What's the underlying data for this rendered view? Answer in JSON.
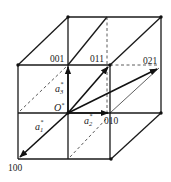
{
  "diagram": {
    "points": {
      "origin": {
        "label": "O",
        "superscript": "*"
      },
      "p001": {
        "label": "001"
      },
      "p011": {
        "label": "011"
      },
      "p021": {
        "label": "021"
      },
      "p010": {
        "label": "010"
      },
      "p100": {
        "label": "100"
      }
    },
    "vectors": {
      "a1": {
        "base": "a",
        "sub": "1",
        "sup": "*"
      },
      "a2": {
        "base": "a",
        "sub": "2",
        "sup": "*"
      },
      "a3": {
        "base": "a",
        "sub": "3",
        "sup": "*"
      }
    },
    "colors": {
      "line": "#1a1a1a",
      "background": "#ffffff"
    }
  }
}
